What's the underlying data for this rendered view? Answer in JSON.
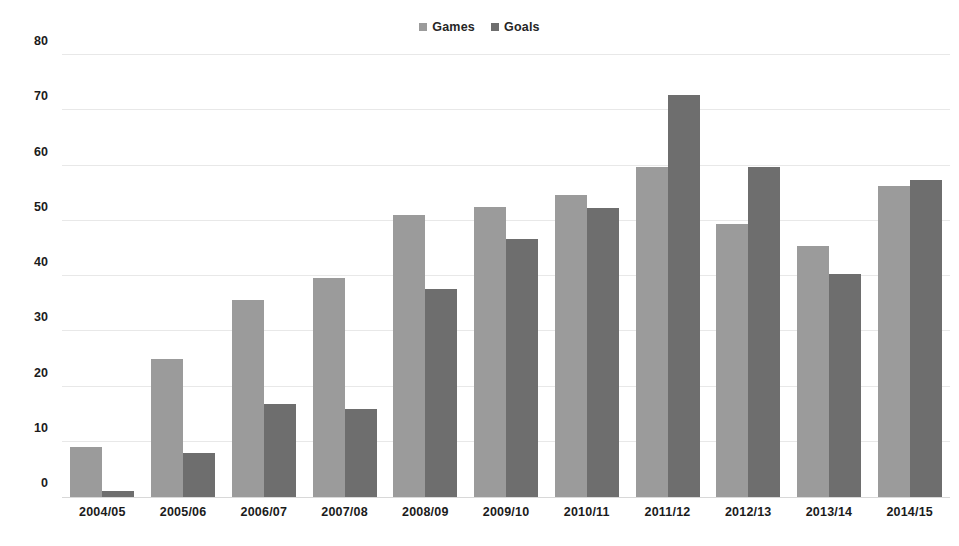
{
  "chart_data": {
    "type": "bar",
    "title": "",
    "subtitle": "",
    "xlabel": "",
    "ylabel": "",
    "categories": [
      "2004/05",
      "2005/06",
      "2006/07",
      "2007/08",
      "2008/09",
      "2009/10",
      "2010/11",
      "2011/12",
      "2012/13",
      "2013/14",
      "2014/15"
    ],
    "series": [
      {
        "name": "Games",
        "color": "#9b9b9b",
        "values": [
          9,
          25,
          35.7,
          39.7,
          51,
          52.5,
          54.6,
          59.8,
          49.5,
          45.4,
          56.3
        ]
      },
      {
        "name": "Goals",
        "color": "#6e6e6e",
        "values": [
          1,
          8,
          16.9,
          15.9,
          37.6,
          46.7,
          52.4,
          72.7,
          59.7,
          40.3,
          57.4
        ]
      }
    ],
    "ylim": [
      0,
      80
    ],
    "ytick_values": [
      80,
      70,
      60,
      50,
      40,
      30,
      20,
      10,
      0
    ],
    "ytick_labels": [
      "80",
      "70",
      "60",
      "50",
      "40",
      "30",
      "20",
      "10",
      "0"
    ],
    "grid": true,
    "grid_axis": "y",
    "legend_position": "top-center",
    "background_color": "#ffffff",
    "gridline_color": "#e8e8e8",
    "text_color": "#1b1b1b"
  },
  "legend": {
    "entries": [
      {
        "label": "Games",
        "swatch_icon": "square-swatch-icon",
        "color": "#9b9b9b"
      },
      {
        "label": "Goals",
        "swatch_icon": "square-swatch-icon",
        "color": "#6e6e6e"
      }
    ]
  }
}
